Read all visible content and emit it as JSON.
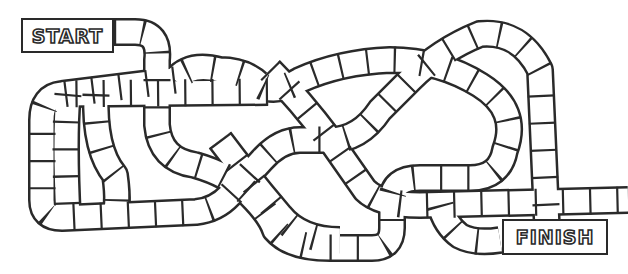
{
  "board": {
    "type": "board-game-track",
    "colors": {
      "line": "#2a2a2a",
      "background": "#ffffff"
    },
    "start_label": "START",
    "finish_label": "FINISH"
  }
}
